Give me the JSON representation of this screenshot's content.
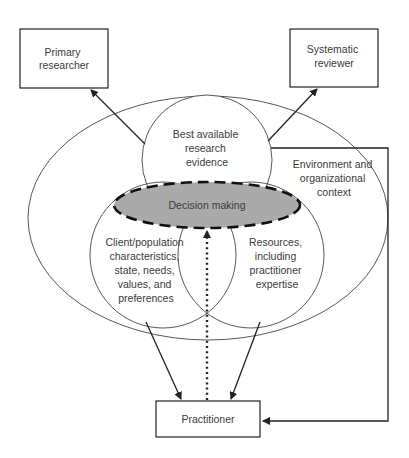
{
  "diagram": {
    "nodes": {
      "primary_researcher": [
        "Primary",
        "researcher"
      ],
      "systematic_reviewer": [
        "Systematic",
        "reviewer"
      ],
      "research_evidence": [
        "Best available",
        "research",
        "evidence"
      ],
      "environment": [
        "Environment and",
        "organizational",
        "context"
      ],
      "decision_making": [
        "Decision making"
      ],
      "client": [
        "Client/population",
        "characteristics,",
        "state, needs,",
        "values, and",
        "preferences"
      ],
      "resources": [
        "Resources,",
        "including",
        "practitioner",
        "expertise"
      ],
      "practitioner": [
        "Practitioner"
      ]
    },
    "edges": [
      {
        "from": "research_evidence",
        "to": "primary_researcher",
        "style": "solid"
      },
      {
        "from": "research_evidence",
        "to": "systematic_reviewer",
        "style": "solid"
      },
      {
        "from": "client",
        "to": "practitioner",
        "style": "solid"
      },
      {
        "from": "resources",
        "to": "practitioner",
        "style": "solid"
      },
      {
        "from": "practitioner",
        "to": "decision_making",
        "style": "dotted"
      },
      {
        "from": "environment",
        "to": "practitioner",
        "style": "solid"
      }
    ],
    "colors": {
      "decision_fill": "#aaaaaa",
      "line": "#222222",
      "text": "#3a3a3a"
    }
  }
}
